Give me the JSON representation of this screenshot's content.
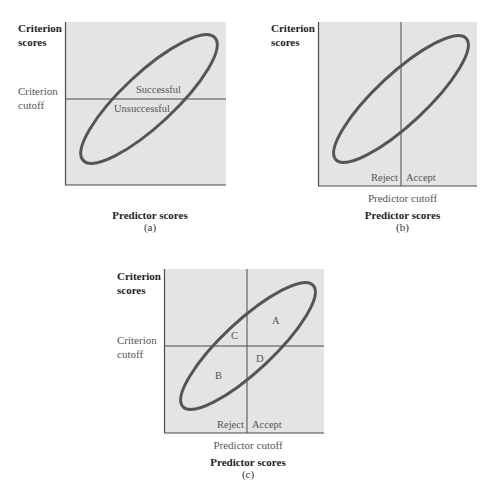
{
  "diagram": {
    "type": "selection-decision-scatter",
    "colors": {
      "panel_fill": "#e4e4e4",
      "axis_line": "#4a4a4a",
      "cutoff_line": "#4a4a4a",
      "ellipse_stroke": "#555555",
      "text": "#555555",
      "bold_text": "#1e1e1e"
    },
    "panels": [
      {
        "id": "a",
        "y_axis_label": [
          "Criterion",
          "scores"
        ],
        "criterion_cutoff_label": [
          "Criterion",
          "cutoff"
        ],
        "x_axis_label": "Predictor scores",
        "caption": "(a)",
        "has_criterion_cutoff": true,
        "has_predictor_cutoff": false,
        "region_labels": {
          "above": "Successful",
          "below": "Unsuccessful"
        }
      },
      {
        "id": "b",
        "y_axis_label": [
          "Criterion",
          "scores"
        ],
        "predictor_cutoff_label": "Predictor cutoff",
        "x_axis_label": "Predictor scores",
        "caption": "(b)",
        "has_criterion_cutoff": false,
        "has_predictor_cutoff": true,
        "decision_labels": {
          "left": "Reject",
          "right": "Accept"
        }
      },
      {
        "id": "c",
        "y_axis_label": [
          "Criterion",
          "scores"
        ],
        "criterion_cutoff_label": [
          "Criterion",
          "cutoff"
        ],
        "predictor_cutoff_label": "Predictor cutoff",
        "x_axis_label": "Predictor scores",
        "caption": "(c)",
        "has_criterion_cutoff": true,
        "has_predictor_cutoff": true,
        "decision_labels": {
          "left": "Reject",
          "right": "Accept"
        },
        "quadrant_labels": {
          "A": "A",
          "B": "B",
          "C": "C",
          "D": "D"
        }
      }
    ]
  }
}
